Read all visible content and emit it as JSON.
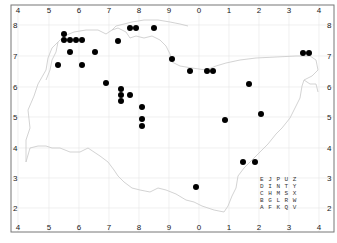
{
  "map": {
    "type": "distribution-map",
    "frame": {
      "left": 11,
      "top": 5,
      "right": 334,
      "bottom": 232
    },
    "x_ticks": [
      {
        "label": "4",
        "x": 18
      },
      {
        "label": "5",
        "x": 49
      },
      {
        "label": "6",
        "x": 79
      },
      {
        "label": "7",
        "x": 109
      },
      {
        "label": "8",
        "x": 139
      },
      {
        "label": "9",
        "x": 169
      },
      {
        "label": "0",
        "x": 199
      },
      {
        "label": "1",
        "x": 229
      },
      {
        "label": "2",
        "x": 259
      },
      {
        "label": "3",
        "x": 289
      },
      {
        "label": "4",
        "x": 319
      }
    ],
    "y_ticks": [
      {
        "label": "8",
        "y": 25
      },
      {
        "label": "7",
        "y": 56
      },
      {
        "label": "6",
        "y": 87
      },
      {
        "label": "5",
        "y": 117
      },
      {
        "label": "4",
        "y": 148
      },
      {
        "label": "3",
        "y": 178
      },
      {
        "label": "2",
        "y": 208
      }
    ],
    "grid_legend": {
      "rows": [
        "E J P U Z",
        "D I N T Y",
        "C H M S X",
        "B G L R W",
        "A F K Q V"
      ],
      "x": 260,
      "y": 181
    },
    "points": [
      [
        64,
        34
      ],
      [
        64,
        40
      ],
      [
        70,
        40
      ],
      [
        76,
        40
      ],
      [
        82,
        40
      ],
      [
        70,
        52
      ],
      [
        95,
        52
      ],
      [
        58,
        65
      ],
      [
        82,
        65
      ],
      [
        130,
        28
      ],
      [
        136,
        28
      ],
      [
        154,
        28
      ],
      [
        118,
        41
      ],
      [
        172,
        59
      ],
      [
        190,
        71
      ],
      [
        207,
        71
      ],
      [
        213,
        71
      ],
      [
        303,
        53
      ],
      [
        309,
        53
      ],
      [
        106,
        83
      ],
      [
        121,
        89
      ],
      [
        121,
        95
      ],
      [
        121,
        101
      ],
      [
        130,
        95
      ],
      [
        142,
        107
      ],
      [
        142,
        119
      ],
      [
        142,
        126
      ],
      [
        249,
        84
      ],
      [
        261,
        114
      ],
      [
        225,
        120
      ],
      [
        243,
        162
      ],
      [
        255,
        162
      ],
      [
        196,
        187
      ]
    ],
    "colors": {
      "point": "#000000",
      "boundary": "#c8c8c8",
      "grid": "#e6e6e6",
      "frame": "#777777"
    }
  }
}
